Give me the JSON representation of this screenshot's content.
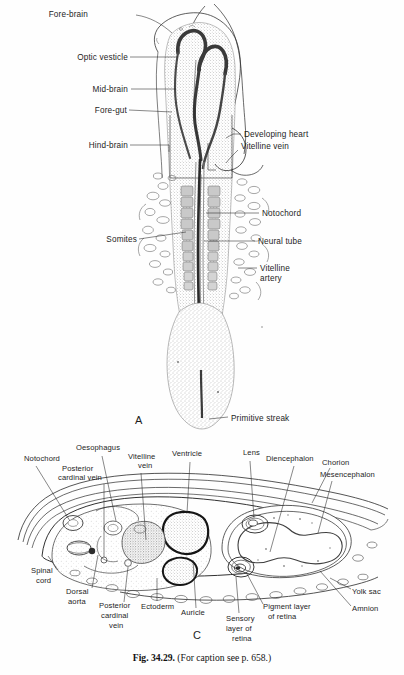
{
  "figure": {
    "caption_bold": "Fig. 34.29.",
    "caption_rest": "(For caption see p. 658.)",
    "panels": [
      {
        "id": "A",
        "letter": "A",
        "description": "Dorsal view of whole embryo showing neural tube, somites and primitive streak"
      },
      {
        "id": "C",
        "letter": "C",
        "description": "Transverse section through embryo, chorion, amnion and yolk sac"
      }
    ]
  },
  "panel_a": {
    "letter": "A",
    "labels": [
      {
        "name": "fore-brain",
        "text": "Fore-brain",
        "side": "left",
        "x": 88,
        "y": 17
      },
      {
        "name": "optic-vesicle",
        "text": "Optic vesticle",
        "side": "left",
        "x": 64,
        "y": 59
      },
      {
        "name": "mid-brain",
        "text": "Mid-brain",
        "side": "left",
        "x": 86,
        "y": 91
      },
      {
        "name": "fore-gut",
        "text": "Fore-gut",
        "side": "left",
        "x": 89,
        "y": 112
      },
      {
        "name": "hind-brain",
        "text": "Hind-brain",
        "side": "left",
        "x": 82,
        "y": 147
      },
      {
        "name": "somites",
        "text": "Somites",
        "side": "left",
        "x": 101,
        "y": 241
      },
      {
        "name": "developing-heart",
        "text": "Developing heart",
        "side": "right",
        "x": 244,
        "y": 136
      },
      {
        "name": "vitelline-vein",
        "text": "Vitelline vein",
        "side": "right",
        "x": 241,
        "y": 148
      },
      {
        "name": "notochord",
        "text": "Notochord",
        "side": "right",
        "x": 262,
        "y": 215
      },
      {
        "name": "neural-tube",
        "text": "Neural tube",
        "side": "right",
        "x": 258,
        "y": 243
      },
      {
        "name": "vitelline-artery-1",
        "text": "Vitelline",
        "side": "right",
        "x": 260,
        "y": 270
      },
      {
        "name": "vitelline-artery-2",
        "text": "artery",
        "side": "right",
        "x": 260,
        "y": 280
      },
      {
        "name": "primitive-streak",
        "text": "Primitive streak",
        "side": "right",
        "x": 230,
        "y": 419
      }
    ]
  },
  "panel_c": {
    "letter": "C",
    "labels": [
      {
        "name": "notochord",
        "text": "Notochord",
        "x": 24,
        "y": 461
      },
      {
        "name": "oesophagus",
        "text": "Oesophagus",
        "x": 76,
        "y": 450
      },
      {
        "name": "posterior-cardinal-1",
        "text": "Posterior",
        "x": 65,
        "y": 470
      },
      {
        "name": "posterior-cardinal-2",
        "text": "cardinal vein",
        "x": 61,
        "y": 479
      },
      {
        "name": "vitelline-vein-1",
        "text": "Vitelline",
        "x": 130,
        "y": 459
      },
      {
        "name": "vitelline-vein-2",
        "text": "vein",
        "x": 140,
        "y": 468
      },
      {
        "name": "ventricle",
        "text": "Ventricle",
        "x": 178,
        "y": 456
      },
      {
        "name": "lens",
        "text": "Lens",
        "x": 245,
        "y": 455
      },
      {
        "name": "diencephalon",
        "text": "Diencephalon",
        "x": 270,
        "y": 460
      },
      {
        "name": "chorion",
        "text": "Chorion",
        "x": 324,
        "y": 463
      },
      {
        "name": "mesencephalon",
        "text": "Mesencephalon",
        "x": 322,
        "y": 476
      },
      {
        "name": "spinal-cord-1",
        "text": "Spinal",
        "x": 32,
        "y": 572
      },
      {
        "name": "spinal-cord-2",
        "text": "cord",
        "x": 36,
        "y": 582
      },
      {
        "name": "dorsal-aorta-1",
        "text": "Dorsal",
        "x": 67,
        "y": 593
      },
      {
        "name": "dorsal-aorta-2",
        "text": "aorta",
        "x": 69,
        "y": 603
      },
      {
        "name": "post-cardinal-v-1",
        "text": "Posterior",
        "x": 100,
        "y": 607
      },
      {
        "name": "post-cardinal-v-2",
        "text": "cardinal",
        "x": 102,
        "y": 617
      },
      {
        "name": "post-cardinal-v-3",
        "text": "vein",
        "x": 110,
        "y": 627
      },
      {
        "name": "ectoderm",
        "text": "Ectoderm",
        "x": 143,
        "y": 608
      },
      {
        "name": "auricle",
        "text": "Auricle",
        "x": 183,
        "y": 614
      },
      {
        "name": "sensory-retina-1",
        "text": "Sensory",
        "x": 228,
        "y": 620
      },
      {
        "name": "sensory-retina-2",
        "text": "layer of",
        "x": 228,
        "y": 630
      },
      {
        "name": "sensory-retina-3",
        "text": "retina",
        "x": 234,
        "y": 640
      },
      {
        "name": "pigment-retina-1",
        "text": "Pigment layer",
        "x": 265,
        "y": 608
      },
      {
        "name": "pigment-retina-2",
        "text": "of retina",
        "x": 270,
        "y": 618
      },
      {
        "name": "yolk-sac",
        "text": "Yolk sac",
        "x": 354,
        "y": 593
      },
      {
        "name": "amnion",
        "text": "Amnion",
        "x": 354,
        "y": 610
      }
    ]
  },
  "colors": {
    "ink": "#2a2a2a",
    "dark_ink": "#1a1a1a",
    "paper": "#fefefe",
    "tissue_fill": "#d8d8d8",
    "neural_dark": "#4a4a4a"
  }
}
